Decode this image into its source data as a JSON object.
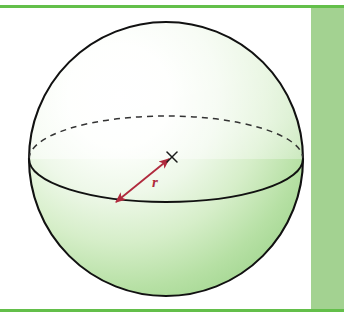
{
  "page": {
    "width": 344,
    "height": 321,
    "background_color": "#ffffff",
    "kind": "textbook-figure-sphere"
  },
  "decorations": {
    "top_rule": {
      "name": "top-green-rule",
      "color": "#63bf4a",
      "x": 0,
      "y": 5,
      "width": 344,
      "height": 3
    },
    "bottom_rule": {
      "name": "bottom-green-rule",
      "color": "#63bf4a",
      "x": 0,
      "y": 309,
      "width": 344,
      "height": 3
    },
    "right_band": {
      "name": "right-green-band",
      "color": "#a3d291",
      "x": 311,
      "y": 8,
      "width": 33,
      "height": 301
    }
  },
  "figure": {
    "sphere": {
      "center_x": 166,
      "center_y": 159,
      "radius": 137,
      "outline_color": "#111111",
      "outline_width": 2.1,
      "fill_light": "#ffffff",
      "fill_mid": "#dff1d6",
      "fill_deep": "#9ed48c"
    },
    "equator": {
      "name": "equator-ellipse",
      "center_x": 166,
      "center_y": 159,
      "rx": 137,
      "ry": 43,
      "front_style": "solid",
      "front_color": "#111111",
      "front_width": 2.0,
      "back_style": "dashed",
      "back_color": "#333333",
      "back_width": 1.5,
      "dash_pattern": "6 5"
    },
    "radius_arrow": {
      "name": "radius-arrow",
      "color": "#b02a3d",
      "width": 1.8,
      "from_x": 115,
      "from_y": 203,
      "to_x": 170,
      "to_y": 158,
      "double_headed": true
    },
    "center_mark": {
      "name": "center-cross-mark",
      "glyph": "x",
      "x": 172,
      "y": 157,
      "color": "#1a1a1a",
      "size": 11
    },
    "radius_label": {
      "name": "radius-label",
      "text": "r",
      "x": 155,
      "y": 187,
      "color": "#b02a3d"
    }
  }
}
